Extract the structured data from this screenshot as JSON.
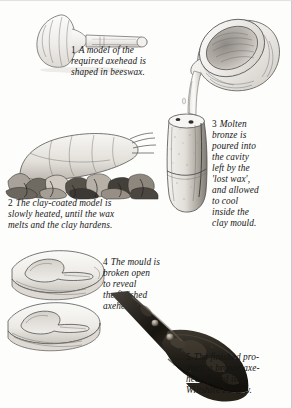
{
  "figure": {
    "panel_count": 5,
    "background_color": "#fdfdfc",
    "text_color": "#151515"
  },
  "panels": [
    {
      "number": "1",
      "caption": "A model of the\nrequired axehead is\nshaped in beeswax.",
      "illustration": "beeswax-axehead-model",
      "style": "pencil-drawing",
      "tone": "#f2f1ee"
    },
    {
      "number": "2",
      "caption": "The clay-coated model is\nslowly heated, until the wax\nmelts and the clay hardens.",
      "illustration": "clay-coated-model-in-fire",
      "style": "pencil-drawing",
      "tone": "#9a958c"
    },
    {
      "number": "3",
      "caption": "Molten\nbronze is\npoured into\nthe cavity\nleft by the\n'lost wax',\nand allowed\nto cool\ninside the\nclay mould.",
      "illustration": "crucible-pouring-into-mould",
      "style": "pencil-drawing",
      "tone": "#e8e6e1"
    },
    {
      "number": "4",
      "caption": "The mould is\nbroken open\nto reveal\nthe finished\naxehead.",
      "illustration": "mould-halves-broken-open",
      "style": "pencil-drawing",
      "tone": "#eceae5"
    },
    {
      "number": "5",
      "caption": "The finished pro-\nduct: a bronze axe-\nhead found in a\nWiltshire barrow.",
      "illustration": "bronze-axehead-photograph",
      "style": "halftone-photograph",
      "tone": "#2a2723"
    }
  ]
}
